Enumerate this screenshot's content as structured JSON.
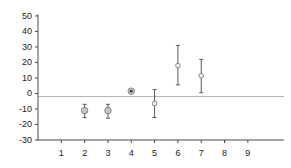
{
  "chart_data": {
    "type": "scatter",
    "title": "",
    "xlabel": "",
    "ylabel": "",
    "grid": false,
    "legend": null,
    "x_ticks": [
      1,
      2,
      3,
      4,
      5,
      6,
      7,
      8,
      9
    ],
    "y_ticks": [
      50,
      40,
      30,
      20,
      10,
      0,
      -10,
      -20,
      -30
    ],
    "xlim": [
      0,
      10.55
    ],
    "ylim": [
      -31.3,
      51
    ],
    "reference_line_y": -2,
    "series": [
      {
        "name": "points-with-error-bars",
        "points": [
          {
            "x": 2,
            "y": -11,
            "err_low": -15.5,
            "err_high": -7,
            "marker": "filled-circle",
            "size": 6.5
          },
          {
            "x": 3,
            "y": -11,
            "err_low": -16,
            "err_high": -7,
            "marker": "filled-circle",
            "size": 6.5
          },
          {
            "x": 4,
            "y": 1.5,
            "err_low": 1.5,
            "err_high": 1.5,
            "marker": "bullseye",
            "size": 6.5
          },
          {
            "x": 5,
            "y": -6.5,
            "err_low": -15.5,
            "err_high": 2.5,
            "marker": "open-circle",
            "size": 4.6
          },
          {
            "x": 6,
            "y": 18,
            "err_low": 5.5,
            "err_high": 31,
            "marker": "open-circle",
            "size": 4.6
          },
          {
            "x": 7,
            "y": 11.5,
            "err_low": 0.5,
            "err_high": 22,
            "marker": "open-circle",
            "size": 4.6
          }
        ]
      }
    ],
    "colors": {
      "background": "#ffffff",
      "axis": "#4a4a4a",
      "tick_label": "#1a1a1a",
      "error_bar": "#5a5a5a",
      "reference_line": "#b4b4b4",
      "marker_fill": "#c6c6c6",
      "marker_stroke": "#858585",
      "open_marker_fill": "#f5f5f5",
      "bullseye_center": "#3a3a3a"
    }
  }
}
